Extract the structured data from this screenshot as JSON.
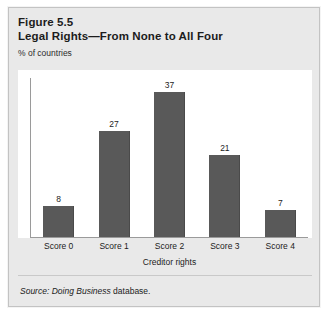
{
  "figure": {
    "number": "Figure 5.5",
    "title": "Legal Rights—From None to All Four",
    "unit_label": "% of countries",
    "source": {
      "label": "Source:",
      "database": "Doing Business",
      "tail": "database."
    }
  },
  "colors": {
    "bar_fill": "#595959",
    "bar_edge": "#4a4a4a",
    "panel_background": "#ffffff",
    "figure_background": "#e9e9e9",
    "figure_border": "#c3c3c3",
    "axis_line": "#9a9a9a",
    "text": "#1c1c1c"
  },
  "chart_data": {
    "type": "bar",
    "title": "Legal Rights—From None to All Four",
    "subtitle": "Figure 5.5",
    "categories": [
      "Score 0",
      "Score 1",
      "Score 2",
      "Score 3",
      "Score 4"
    ],
    "values": [
      8,
      27,
      37,
      21,
      7
    ],
    "xlabel": "Creditor rights",
    "ylabel": "% of countries",
    "ylim": [
      0,
      40
    ],
    "grid": false,
    "legend": false,
    "data_labels": true
  }
}
